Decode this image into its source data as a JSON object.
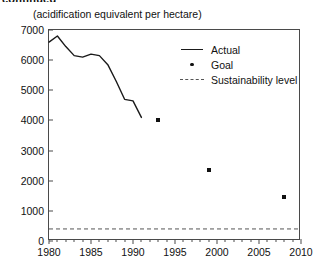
{
  "header": {
    "cut_off_title": "continued",
    "subtitle": "(acidification equivalent per hectare)"
  },
  "legend": {
    "items": [
      {
        "label": "Actual",
        "key": "solid-line",
        "color": "#1a1a1a"
      },
      {
        "label": "Goal",
        "key": "dot-marker",
        "color": "#111111"
      },
      {
        "label": "Sustainability level",
        "key": "dashed-line",
        "color": "#555555"
      }
    ]
  },
  "chart_data": {
    "type": "line",
    "title": "",
    "subtitle": "(acidification equivalent per hectare)",
    "xlabel": "",
    "ylabel": "",
    "xlim": [
      1980,
      2010
    ],
    "ylim": [
      0,
      7000
    ],
    "grid": false,
    "legend_position": "upper-right-inside",
    "y_ticks": [
      0,
      1000,
      2000,
      3000,
      4000,
      5000,
      6000,
      7000
    ],
    "x_ticks_major": [
      1980,
      1985,
      1990,
      1995,
      2000,
      2005,
      2010
    ],
    "x_tick_minor_step": 1,
    "series": [
      {
        "name": "Actual",
        "type": "line",
        "x": [
          1980,
          1981,
          1982,
          1983,
          1984,
          1985,
          1986,
          1987,
          1988,
          1989,
          1990,
          1991
        ],
        "values": [
          6600,
          6800,
          6450,
          6150,
          6100,
          6200,
          6150,
          5850,
          5300,
          4700,
          4650,
          4100
        ]
      },
      {
        "name": "Goal",
        "type": "scatter",
        "x": [
          1993,
          1999,
          2008
        ],
        "values": [
          4000,
          2350,
          1450
        ]
      },
      {
        "name": "Sustainability level",
        "type": "hline",
        "value": 400
      }
    ]
  }
}
